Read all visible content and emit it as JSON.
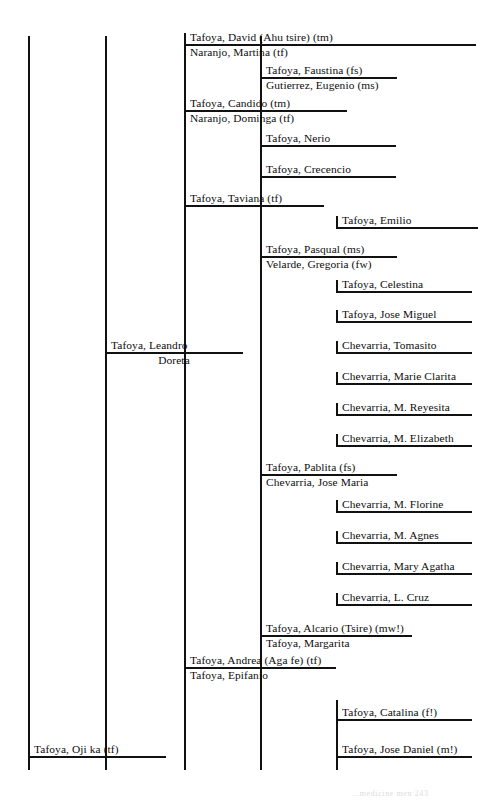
{
  "chart_title": "Tafoya family genealogical descent chart",
  "footer_note": "...medicine men  243",
  "colors": {
    "line": "#111111",
    "text": "#0d0d0d",
    "background": "#ffffff"
  },
  "generations": [
    {
      "id": "g1",
      "x": 28,
      "label": "generation-1-spine"
    },
    {
      "id": "g2",
      "x": 105,
      "label": "generation-2-spine"
    },
    {
      "id": "g3",
      "x": 184,
      "label": "generation-3-spine"
    },
    {
      "id": "g4",
      "x": 260,
      "label": "generation-4-spine"
    },
    {
      "id": "g5",
      "x": 336,
      "label": "generation-5-spine"
    }
  ],
  "people": [
    {
      "id": "p1",
      "name": "Tafoya, David (Ahu tsire) (tm)",
      "spouse": "Naranjo, Martina (tf)",
      "x": 184,
      "y": 44,
      "line_end": 476,
      "generation": 3
    },
    {
      "id": "p2",
      "name": "Tafoya, Faustina (fs)",
      "spouse": "Gutierrez, Eugenio (ms)",
      "x": 260,
      "y": 77,
      "line_end": 397,
      "generation": 4
    },
    {
      "id": "p3",
      "name": "Tafoya, Candido (tm)",
      "spouse": "Naranjo, Dominga (tf)",
      "x": 184,
      "y": 110,
      "line_end": 347,
      "generation": 3
    },
    {
      "id": "p4",
      "name": "Tafoya, Nerio",
      "spouse": null,
      "x": 260,
      "y": 145,
      "line_end": 396,
      "generation": 4
    },
    {
      "id": "p5",
      "name": "Tafoya, Crecencio",
      "spouse": null,
      "x": 260,
      "y": 176,
      "line_end": 396,
      "generation": 4
    },
    {
      "id": "p6",
      "name": "Tafoya, Taviana (tf)",
      "spouse": null,
      "x": 184,
      "y": 205,
      "line_end": 324,
      "generation": 3
    },
    {
      "id": "p7",
      "name": "Tafoya, Emilio",
      "spouse": null,
      "x": 336,
      "y": 227,
      "line_end": 478,
      "generation": 5
    },
    {
      "id": "p8",
      "name": "Tafoya, Pasqual (ms)",
      "spouse": "Velarde, Gregoria (fw)",
      "x": 260,
      "y": 256,
      "line_end": 397,
      "generation": 4
    },
    {
      "id": "p9",
      "name": "Tafoya, Celestina",
      "spouse": null,
      "x": 336,
      "y": 291,
      "line_end": 472,
      "generation": 5
    },
    {
      "id": "p10",
      "name": "Tafoya, Jose Miguel",
      "spouse": null,
      "x": 336,
      "y": 321,
      "line_end": 472,
      "generation": 5
    },
    {
      "id": "p11",
      "name": "Tafoya, Leandro",
      "spouse": "Doreta",
      "x": 105,
      "y": 352,
      "line_end": 243,
      "generation": 2,
      "spouse_centered": true
    },
    {
      "id": "p12",
      "name": "Chevarria, Tomasito",
      "spouse": null,
      "x": 336,
      "y": 352,
      "line_end": 472,
      "generation": 5
    },
    {
      "id": "p13",
      "name": "Chevarria, Marie Clarita",
      "spouse": null,
      "x": 336,
      "y": 383,
      "line_end": 472,
      "generation": 5
    },
    {
      "id": "p14",
      "name": "Chevarria, M. Reyesita",
      "spouse": null,
      "x": 336,
      "y": 414,
      "line_end": 472,
      "generation": 5
    },
    {
      "id": "p15",
      "name": "Chevarria, M. Elizabeth",
      "spouse": null,
      "x": 336,
      "y": 445,
      "line_end": 472,
      "generation": 5
    },
    {
      "id": "p16",
      "name": "Tafoya, Pablita (fs)",
      "spouse": "Chevarria, Jose Maria",
      "x": 260,
      "y": 474,
      "line_end": 397,
      "generation": 4
    },
    {
      "id": "p17",
      "name": "Chevarria, M. Florine",
      "spouse": null,
      "x": 336,
      "y": 511,
      "line_end": 472,
      "generation": 5
    },
    {
      "id": "p18",
      "name": "Chevarria, M. Agnes",
      "spouse": null,
      "x": 336,
      "y": 542,
      "line_end": 472,
      "generation": 5
    },
    {
      "id": "p19",
      "name": "Chevarria, Mary Agatha",
      "spouse": null,
      "x": 336,
      "y": 573,
      "line_end": 472,
      "generation": 5
    },
    {
      "id": "p20",
      "name": "Chevarria, L. Cruz",
      "spouse": null,
      "x": 336,
      "y": 604,
      "line_end": 472,
      "generation": 5
    },
    {
      "id": "p21",
      "name": "Tafoya, Alcario (Tsire) (mw!)",
      "spouse": "Tafoya, Margarita",
      "x": 260,
      "y": 635,
      "line_end": 412,
      "generation": 4
    },
    {
      "id": "p22",
      "name": "Tafoya, Andrea (Aga fe) (tf)",
      "spouse": "Tafoya, Epifanio",
      "x": 184,
      "y": 667,
      "line_end": 336,
      "generation": 3
    },
    {
      "id": "p23",
      "name": "Tafoya, Catalina (f!)",
      "spouse": null,
      "x": 336,
      "y": 719,
      "line_end": 472,
      "generation": 5
    },
    {
      "id": "p24",
      "name": "Tafoya, Jose Daniel (m!)",
      "spouse": null,
      "x": 336,
      "y": 756,
      "line_end": 472,
      "generation": 5
    },
    {
      "id": "p25",
      "name": "Tafoya, Oji ka (tf)",
      "spouse": null,
      "x": 28,
      "y": 756,
      "line_end": 166,
      "generation": 1
    }
  ],
  "spines": [
    {
      "id": "s1",
      "x": 28,
      "y1": 36,
      "y2": 770
    },
    {
      "id": "s2",
      "x": 105,
      "y1": 36,
      "y2": 770
    },
    {
      "id": "s3",
      "x": 184,
      "y1": 36,
      "y2": 770
    },
    {
      "id": "s4",
      "x": 260,
      "y1": 36,
      "y2": 770
    },
    {
      "id": "s5",
      "x": 336,
      "y1": 700,
      "y2": 770
    }
  ]
}
